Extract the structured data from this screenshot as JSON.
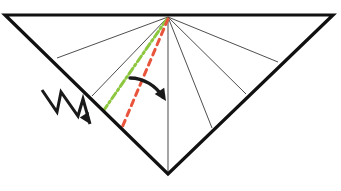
{
  "figure": {
    "title": "",
    "caption": "",
    "background_color": "#ffffff",
    "width": 341,
    "height": 191
  },
  "colors": {
    "outline": "#111111",
    "fan_line": "#3a3a3a",
    "center_line": "#5a5a5a",
    "green_dashdot": "#8DC63F",
    "red_dashed": "#E8543C",
    "arrow": "#1a1a1a",
    "background": "#ffffff"
  },
  "shape": {
    "name": "inverted-triangle-outline",
    "type": "polygon",
    "stroke_width": 3.2,
    "vertices": [
      {
        "label": "top-left",
        "x": 5,
        "y": 15
      },
      {
        "label": "top-right",
        "x": 333,
        "y": 15
      },
      {
        "label": "bottom-apex",
        "x": 168,
        "y": 174
      }
    ]
  },
  "apex": {
    "label": "fan-origin",
    "x": 168,
    "y": 17
  },
  "fan_lines": [
    {
      "name": "fan-line-left-outer",
      "x1": 168,
      "y1": 17,
      "x2": 57,
      "y2": 58,
      "width": 0.9
    },
    {
      "name": "fan-line-left-inner",
      "x1": 168,
      "y1": 17,
      "x2": 92,
      "y2": 96,
      "width": 0.9
    },
    {
      "name": "fan-line-center-vertical",
      "x1": 168,
      "y1": 17,
      "x2": 168,
      "y2": 174,
      "width": 1.1
    },
    {
      "name": "fan-line-right-inner",
      "x1": 168,
      "y1": 17,
      "x2": 212,
      "y2": 128,
      "width": 0.9
    },
    {
      "name": "fan-line-right-middle",
      "x1": 168,
      "y1": 17,
      "x2": 246,
      "y2": 94,
      "width": 0.9
    },
    {
      "name": "fan-line-right-outer",
      "x1": 168,
      "y1": 17,
      "x2": 278,
      "y2": 62,
      "width": 0.9
    }
  ],
  "green_line": {
    "name": "green-dash-dot-ray",
    "style": "dash-dot",
    "color": "#8DC63F",
    "width": 3.0,
    "dash_pattern": "7,3,2,3",
    "x1": 167,
    "y1": 19,
    "x2": 104,
    "y2": 110
  },
  "red_line": {
    "name": "red-dashed-ray",
    "style": "dashed",
    "color": "#E8543C",
    "width": 3.0,
    "dash_pattern": "6,5",
    "x1": 168,
    "y1": 19,
    "x2": 121,
    "y2": 130
  },
  "zigzag_arrow": {
    "name": "zigzag-incident-arrow",
    "color": "#1a1a1a",
    "width": 3.0,
    "points": "42,90 57,112 61,92 78,116 83,99 90,124",
    "head": {
      "x": 90,
      "y": 124,
      "angle_deg": 58,
      "size": 11
    }
  },
  "curved_arrow": {
    "name": "rotation-curved-arrow",
    "color": "#1a1a1a",
    "width": 3.4,
    "path": "M 130,78 C 144,78 156,86 163,97",
    "head": {
      "x": 166,
      "y": 101,
      "angle_deg": 57,
      "size": 12
    }
  }
}
